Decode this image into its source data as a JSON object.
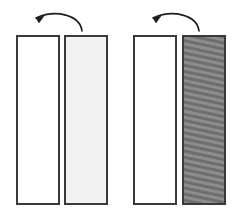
{
  "figure": {
    "canvas": {
      "width": 239,
      "height": 216,
      "background": "#ffffff"
    },
    "stroke_color": "#3a3a3a",
    "arrow_color": "#1d1d1d"
  },
  "groups": [
    {
      "name": "left-pair",
      "arrow": {
        "name": "rotation-arrow-left",
        "direction": "right-to-left",
        "arc_path": "M 82 31 C 80 15 56 9 36 18",
        "head_path": "M 36 18 L 44 16 L 39 23 Z",
        "label": ""
      },
      "panels": [
        {
          "name": "panel-1-front",
          "x": 17,
          "y": 36,
          "width": 42,
          "height": 168,
          "fill": "#ffffff",
          "pattern": "none",
          "state": "blank"
        },
        {
          "name": "panel-2-back",
          "x": 65,
          "y": 36,
          "width": 42,
          "height": 168,
          "fill": "#f2f2f2",
          "pattern": "none",
          "state": "light"
        }
      ]
    },
    {
      "name": "right-pair",
      "arrow": {
        "name": "rotation-arrow-right",
        "direction": "right-to-left",
        "arc_path": "M 199 31 C 197 15 173 9 153 18",
        "head_path": "M 153 18 L 161 16 L 156 23 Z",
        "label": ""
      },
      "panels": [
        {
          "name": "panel-3-front",
          "x": 134,
          "y": 36,
          "width": 42,
          "height": 168,
          "fill": "#ffffff",
          "pattern": "none",
          "state": "blank"
        },
        {
          "name": "panel-4-back",
          "x": 183,
          "y": 36,
          "width": 42,
          "height": 168,
          "fill": "#808080",
          "pattern": "diagonal-stripes",
          "state": "hatched"
        }
      ]
    }
  ]
}
